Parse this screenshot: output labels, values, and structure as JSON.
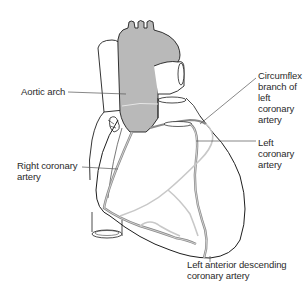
{
  "figure": {
    "colors": {
      "aorta_fill": "#b9b9b9",
      "outline": "#1e1e1e",
      "artery": "#8a8a8a",
      "vein_light": "#c8c8c8",
      "leader_line": "#555555",
      "text": "#2a2a2a",
      "background": "#ffffff"
    }
  },
  "labels": {
    "aortic_arch": "Aortic arch",
    "circumflex": "Circumflex\nbranch of\nleft coronary\nartery",
    "left_coronary": "Left coronary\nartery",
    "right_coronary": "Right coronary\nartery",
    "lad": "Left anterior descending\ncoronary artery"
  }
}
